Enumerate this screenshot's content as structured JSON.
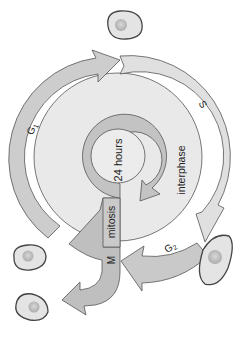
{
  "diagram": {
    "orientation": "rotated 90 degrees clockwise",
    "center_label": "24 hours",
    "phase_labels": {
      "g1": {
        "letter": "G",
        "sub": "1"
      },
      "s": "S",
      "g2": {
        "letter": "G",
        "sub": "2"
      },
      "m": "M"
    },
    "region_labels": {
      "interphase": "interphase",
      "mitosis": "mitosis"
    },
    "cells_count": 5,
    "colors": {
      "outer_band": "#d6d6d6",
      "g1_arrow": "#c4c4c4",
      "s_band": "#e2e2e2",
      "g2_arrow": "#c8c8c8",
      "m_arrow": "#bdbdbd",
      "inner_disc": "#ececec",
      "inner_ring": "#c0c0c0",
      "stroke": "#4a4a4a",
      "cell_fill": "#e6e6e6",
      "nucleus": "#bdbdbd"
    }
  }
}
